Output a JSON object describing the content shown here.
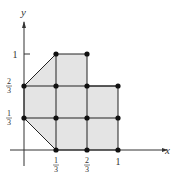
{
  "diagram": {
    "axes": {
      "x_label": "x",
      "y_label": "y",
      "x_ticks": [
        {
          "num": "1",
          "den": "3"
        },
        {
          "num": "2",
          "den": "3"
        },
        {
          "whole": "1"
        }
      ],
      "y_ticks": [
        {
          "num": "1",
          "den": "3"
        },
        {
          "num": "2",
          "den": "3"
        },
        {
          "whole": "1"
        }
      ]
    },
    "region_fill": "#e4e4e4",
    "line_color": "#222222",
    "points": [
      [
        0,
        0.3333
      ],
      [
        0,
        0.6667
      ],
      [
        0.3333,
        0
      ],
      [
        0.6667,
        0
      ],
      [
        1,
        0
      ],
      [
        0.3333,
        0.3333
      ],
      [
        0.6667,
        0.3333
      ],
      [
        1,
        0.3333
      ],
      [
        0.3333,
        0.6667
      ],
      [
        0.6667,
        0.6667
      ],
      [
        1,
        0.6667
      ],
      [
        0.3333,
        1
      ],
      [
        0.6667,
        1
      ]
    ]
  }
}
